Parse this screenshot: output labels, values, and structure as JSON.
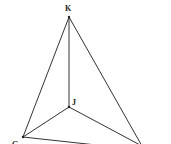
{
  "diagram": {
    "type": "tetrahedron",
    "vertices": [
      {
        "label": "K",
        "x": 69,
        "y": 17,
        "lx": 65,
        "ly": 11
      },
      {
        "label": "J",
        "x": 69,
        "y": 107,
        "lx": 73,
        "ly": 105
      },
      {
        "label": "G",
        "x": 23,
        "y": 137,
        "lx": 12,
        "ly": 147
      },
      {
        "label": "",
        "x": 142,
        "y": 146,
        "lx": 0,
        "ly": 0
      }
    ],
    "edges": [
      [
        "K",
        "J"
      ],
      [
        "K",
        "G"
      ],
      [
        "K",
        "R"
      ],
      [
        "J",
        "G"
      ],
      [
        "J",
        "R"
      ],
      [
        "G",
        "R"
      ]
    ],
    "labels": {
      "k": "K",
      "j": "J",
      "g": "G"
    }
  }
}
